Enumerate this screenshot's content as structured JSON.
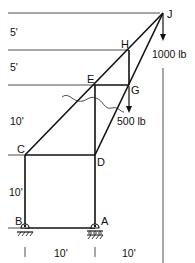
{
  "diagram": {
    "type": "truss",
    "nodes": [
      {
        "id": "J",
        "label": "J",
        "x": 163,
        "y": 13
      },
      {
        "id": "H",
        "label": "H",
        "x": 129,
        "y": 50
      },
      {
        "id": "E",
        "label": "E",
        "x": 94,
        "y": 85
      },
      {
        "id": "G",
        "label": "G",
        "x": 129,
        "y": 85
      },
      {
        "id": "C",
        "label": "C",
        "x": 25,
        "y": 155
      },
      {
        "id": "D",
        "label": "D",
        "x": 95,
        "y": 155
      },
      {
        "id": "B",
        "label": "B",
        "x": 25,
        "y": 228
      },
      {
        "id": "A",
        "label": "A",
        "x": 95,
        "y": 228
      }
    ],
    "members": [
      [
        "C",
        "J"
      ],
      [
        "D",
        "J"
      ],
      [
        "H",
        "G"
      ],
      [
        "E",
        "G"
      ],
      [
        "E",
        "D"
      ],
      [
        "C",
        "D"
      ],
      [
        "C",
        "B"
      ],
      [
        "D",
        "A"
      ],
      [
        "B",
        "A"
      ]
    ],
    "loads": [
      {
        "node": "J",
        "label": "1000 lb"
      },
      {
        "node": "G",
        "label": "500 lb"
      }
    ],
    "supports": [
      {
        "node": "B",
        "type": "pin"
      },
      {
        "node": "A",
        "type": "roller"
      }
    ],
    "vertical_dimensions": [
      "5'",
      "5'",
      "10'",
      "10'"
    ],
    "horizontal_dimensions": [
      "10'",
      "10'"
    ],
    "section_cut": "wavy line through members CE, ED, DG"
  }
}
